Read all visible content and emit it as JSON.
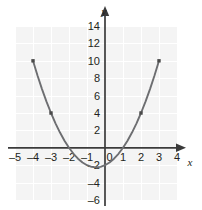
{
  "chart_data": {
    "type": "line",
    "title": "",
    "subtitle": "",
    "xlabel": "x",
    "ylabel": "y",
    "xlim": [
      -5,
      4
    ],
    "ylim": [
      -6,
      14
    ],
    "grid": true,
    "legend": "none",
    "equation": "y = x^2 + x - 2",
    "x_ticks": [
      -5,
      -4,
      -3,
      -2,
      -1,
      0,
      1,
      2,
      3,
      4
    ],
    "x_tick_labels": [
      "–5",
      "–4",
      "–3",
      "–2",
      "–1",
      "0",
      "1",
      "2",
      "3",
      "4"
    ],
    "y_ticks": [
      -6,
      -4,
      -2,
      0,
      2,
      4,
      6,
      8,
      10,
      12,
      14
    ],
    "y_tick_labels": [
      "–6",
      "–4",
      "–2",
      "0",
      "2",
      "4",
      "6",
      "8",
      "10",
      "12",
      "14"
    ],
    "x_minor_step": 1,
    "y_minor_step": 2,
    "curve": {
      "name": "parabola",
      "x": [
        -4,
        -3.75,
        -3.5,
        -3.25,
        -3,
        -2.75,
        -2.5,
        -2.25,
        -2,
        -1.75,
        -1.5,
        -1.25,
        -1,
        -0.75,
        -0.5,
        -0.25,
        0,
        0.25,
        0.5,
        0.75,
        1,
        1.25,
        1.5,
        1.75,
        2,
        2.25,
        2.5,
        2.75,
        3
      ],
      "y": [
        10,
        8.3125,
        6.75,
        5.3125,
        4,
        2.8125,
        1.75,
        0.8125,
        0,
        -0.6875,
        -1.25,
        -1.6875,
        -2,
        -2.1875,
        -2.25,
        -2.1875,
        -2,
        -1.6875,
        -1.25,
        -0.6875,
        0,
        0.8125,
        1.75,
        2.8125,
        4,
        5.3125,
        6.75,
        8.3125,
        10
      ]
    },
    "points": [
      {
        "x": -4,
        "y": 10
      },
      {
        "x": -3,
        "y": 4
      },
      {
        "x": 2,
        "y": 4
      },
      {
        "x": 3,
        "y": 10
      }
    ],
    "vertex": {
      "x": -0.5,
      "y": -2.25
    },
    "x_intercepts": [
      -2,
      1
    ],
    "y_intercept": -2,
    "colors": {
      "plot_background": "#f4f4f4",
      "gridline": "#ffffff",
      "axis": "#3a3a3a",
      "curve": "#6d6e71",
      "marker": "#4a4a4a",
      "text": "#231f20",
      "page_background": "#ffffff"
    }
  }
}
